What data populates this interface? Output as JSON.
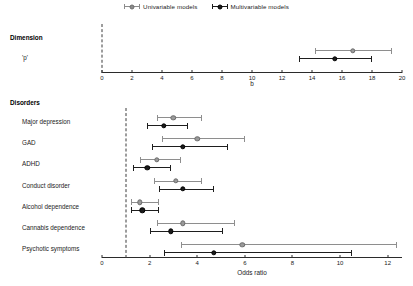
{
  "legend": {
    "entries": [
      {
        "label": "Univariable models",
        "marker": "circle-gray",
        "color": "#8c8c8c"
      },
      {
        "label": "Multivariable models",
        "marker": "circle-black",
        "color": "#1b1b1b"
      }
    ]
  },
  "chart_data": {
    "type": "scatter",
    "title": "",
    "panels": [
      {
        "name": "dimension-panel",
        "group_label": "Dimension",
        "xlabel": "b",
        "xlim": [
          0,
          20
        ],
        "xticks": [
          0,
          2,
          4,
          6,
          8,
          10,
          12,
          14,
          16,
          18,
          20
        ],
        "xtick_labels": [
          "0",
          "2",
          "4",
          "6",
          "8",
          "10",
          "12",
          "14",
          "16",
          "18",
          "20"
        ],
        "reference_line": 0,
        "grid": false,
        "rows": [
          {
            "label": "'p'",
            "series": [
              {
                "name": "Univariable models",
                "estimate": 16.7,
                "low": 14.2,
                "high": 19.3
              },
              {
                "name": "Multivariable models",
                "estimate": 15.5,
                "low": 13.1,
                "high": 18.0
              }
            ]
          }
        ]
      },
      {
        "name": "disorders-panel",
        "group_label": "Disorders",
        "xlabel": "Odds ratio",
        "xlim": [
          0,
          12.6
        ],
        "xticks": [
          0,
          2,
          4,
          6,
          8,
          10,
          12
        ],
        "xtick_labels": [
          "0",
          "2",
          "4",
          "6",
          "8",
          "10",
          "12"
        ],
        "reference_line": 1,
        "grid": false,
        "rows": [
          {
            "label": "Major depression",
            "series": [
              {
                "name": "Univariable models",
                "estimate": 3.0,
                "low": 2.3,
                "high": 4.2
              },
              {
                "name": "Multivariable models",
                "estimate": 2.6,
                "low": 1.9,
                "high": 3.6
              }
            ]
          },
          {
            "label": "GAD",
            "series": [
              {
                "name": "Univariable models",
                "estimate": 4.0,
                "low": 2.5,
                "high": 6.0
              },
              {
                "name": "Multivariable models",
                "estimate": 3.4,
                "low": 2.1,
                "high": 5.3
              }
            ]
          },
          {
            "label": "ADHD",
            "series": [
              {
                "name": "Univariable models",
                "estimate": 2.3,
                "low": 1.6,
                "high": 3.3
              },
              {
                "name": "Multivariable models",
                "estimate": 1.9,
                "low": 1.3,
                "high": 2.9
              }
            ]
          },
          {
            "label": "Conduct disorder",
            "series": [
              {
                "name": "Univariable models",
                "estimate": 3.1,
                "low": 2.2,
                "high": 4.2
              },
              {
                "name": "Multivariable models",
                "estimate": 3.4,
                "low": 2.4,
                "high": 4.7
              }
            ]
          },
          {
            "label": "Alcohol dependence",
            "series": [
              {
                "name": "Univariable models",
                "estimate": 1.6,
                "low": 1.2,
                "high": 2.4
              },
              {
                "name": "Multivariable models",
                "estimate": 1.7,
                "low": 1.2,
                "high": 2.4
              }
            ]
          },
          {
            "label": "Cannabis dependence",
            "series": [
              {
                "name": "Univariable models",
                "estimate": 3.4,
                "low": 2.3,
                "high": 5.6
              },
              {
                "name": "Multivariable models",
                "estimate": 2.9,
                "low": 2.0,
                "high": 5.1
              }
            ]
          },
          {
            "label": "Psychotic symptoms",
            "series": [
              {
                "name": "Univariable models",
                "estimate": 5.9,
                "low": 3.3,
                "high": 12.4
              },
              {
                "name": "Multivariable models",
                "estimate": 4.7,
                "low": 2.6,
                "high": 10.5
              }
            ]
          }
        ]
      }
    ]
  }
}
